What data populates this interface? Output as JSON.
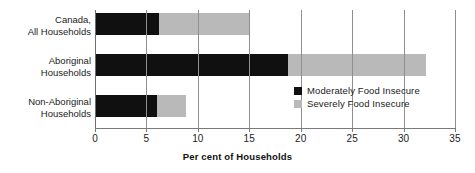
{
  "chart_data": {
    "type": "bar",
    "orientation": "horizontal",
    "stacked": true,
    "title": "",
    "xlabel": "Per cent of Households",
    "ylabel": "",
    "xlim": [
      0,
      35
    ],
    "xticks": [
      "0",
      "5",
      "10",
      "15",
      "20",
      "25",
      "30",
      "35"
    ],
    "xtick_values": [
      0,
      5,
      10,
      15,
      20,
      25,
      30,
      35
    ],
    "grid": "vertical",
    "legend_position": "inside-right-lower",
    "categories": [
      "Canada,\nAll Households",
      "Aboriginal\nHouseholds",
      "Non-Aboriginal\nHouseholds"
    ],
    "series": [
      {
        "name": "Moderately Food Insecure",
        "color": "#101010",
        "values": [
          6.2,
          18.8,
          6.0
        ]
      },
      {
        "name": "Severely Food Insecure",
        "color": "#b9b9b9",
        "values": [
          8.8,
          13.4,
          2.8
        ]
      }
    ],
    "totals": [
      15.0,
      32.2,
      8.8
    ]
  },
  "legend": {
    "items": [
      {
        "label": "Moderately Food Insecure",
        "color": "#101010"
      },
      {
        "label": "Severely Food Insecure",
        "color": "#b9b9b9"
      }
    ]
  }
}
